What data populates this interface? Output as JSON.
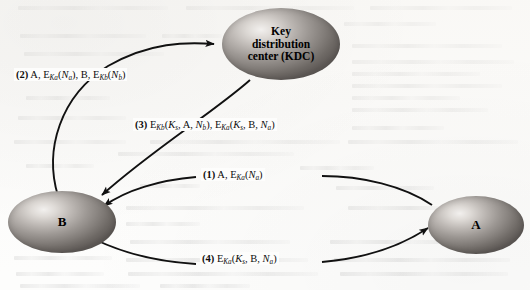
{
  "figure": {
    "background_color": "#fdfdfc",
    "node_fill_color": "#9d9894",
    "line_color": "#111111"
  },
  "nodes": {
    "kdc": {
      "id": "kdc",
      "line1": "Key",
      "line2": "distribution",
      "line3": "center (KDC)"
    },
    "b": {
      "id": "b",
      "label": "B"
    },
    "a": {
      "id": "a",
      "label": "A"
    }
  },
  "messages": [
    {
      "number": "(1)",
      "from": "A",
      "to": "B",
      "text": "(1) A, EKa(Na)",
      "parts": {
        "num": "(1)",
        "plain1": "A, E",
        "sub1": "Ka",
        "open": "(",
        "n1": "N",
        "subn1": "a",
        "close": ")"
      }
    },
    {
      "number": "(2)",
      "from": "B",
      "to": "KDC",
      "text": "(2) A, EKa(Na), B, EKb(Nb)",
      "parts": {
        "num": "(2)",
        "plain1": "A, E",
        "sub1": "Ka",
        "mid1": "(",
        "n1": "N",
        "subn1": "a",
        "mid2": "), B, E",
        "sub2": "Kb",
        "mid3": "(",
        "n2": "N",
        "subn2": "b",
        "close": ")"
      }
    },
    {
      "number": "(3)",
      "from": "KDC",
      "to": "B",
      "text": "(3) EKb(Ks, A, Nb), EKa(Ks, B, Na)",
      "parts": {
        "num": "(3)",
        "e1": "E",
        "sub1": "Kb",
        "open1": "(",
        "k1": "K",
        "subk1": "s",
        "mid1": ", A, ",
        "n1": "N",
        "subn1": "b",
        "close1": "), E",
        "sub2": "Ka",
        "open2": "(",
        "k2": "K",
        "subk2": "s",
        "mid2": ", B, ",
        "n2": "N",
        "subn2": "a",
        "close2": ")"
      }
    },
    {
      "number": "(4)",
      "from": "B",
      "to": "A",
      "text": "(4) EKa(Ks, B, Na)",
      "parts": {
        "num": "(4)",
        "e1": "E",
        "sub1": "Ka",
        "open1": "(",
        "k1": "K",
        "subk1": "s",
        "mid1": ", B, ",
        "n1": "N",
        "subn1": "a",
        "close1": ")"
      }
    }
  ]
}
